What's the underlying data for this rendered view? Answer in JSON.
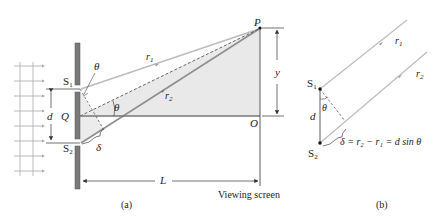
{
  "figure": {
    "panel_a": {
      "caption": "(a)",
      "labels": {
        "S1": "S",
        "S1_sub": "1",
        "S2": "S",
        "S2_sub": "2",
        "theta_top": "θ",
        "theta_mid": "θ",
        "d": "d",
        "Q": "Q",
        "delta": "δ",
        "r1": "r",
        "r1_sub": "1",
        "r2": "r",
        "r2_sub": "2",
        "P": "P",
        "y": "y",
        "O": "O",
        "L": "L",
        "screen": "Viewing screen"
      }
    },
    "panel_b": {
      "caption": "(b)",
      "labels": {
        "S1": "S",
        "S1_sub": "1",
        "S2": "S",
        "S2_sub": "2",
        "theta": "θ",
        "d": "d",
        "r1": "r",
        "r1_sub": "1",
        "r2": "r",
        "r2_sub": "2",
        "equation": "δ = r₂ − r₁ = d sin θ"
      }
    },
    "colors": {
      "barrier": "#7a7a7a",
      "ray": "#b8b8b8",
      "ray_dark": "#8c8c8c",
      "shade": "#e6e6e6",
      "line": "#333333"
    }
  }
}
